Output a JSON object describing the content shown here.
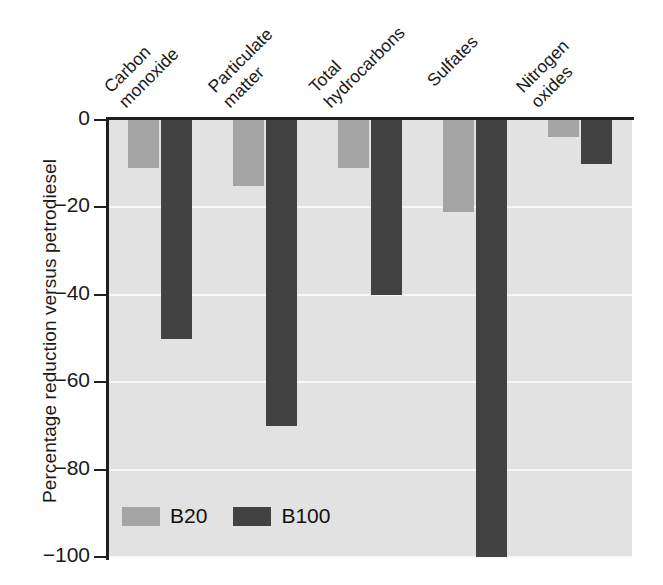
{
  "chart_data": {
    "type": "bar",
    "title": "",
    "xlabel": "",
    "ylabel": "Percentage reduction versus petrodiesel",
    "ylim": [
      -100,
      0
    ],
    "yticks": [
      0,
      -20,
      -40,
      -60,
      -80,
      -100
    ],
    "ytick_labels": [
      "0",
      "−20",
      "−40",
      "−60",
      "−80",
      "−100"
    ],
    "grid": true,
    "grid_axis": "y",
    "legend_position": "bottom-left-inside",
    "categories": [
      "Carbon monoxide",
      "Particulate matter",
      "Total hydrocarbons",
      "Sulfates",
      "Nitrogen oxides"
    ],
    "category_lines": [
      [
        "Carbon",
        "monoxide"
      ],
      [
        "Particulate",
        "matter"
      ],
      [
        "Total",
        "hydrocarbons"
      ],
      [
        "Sulfates",
        ""
      ],
      [
        "Nitrogen",
        "oxides"
      ]
    ],
    "series": [
      {
        "name": "B20",
        "color": "#a5a5a5",
        "values": [
          -11,
          -15,
          -11,
          -21,
          -4
        ]
      },
      {
        "name": "B100",
        "color": "#424242",
        "values": [
          -50,
          -70,
          -40,
          -100,
          -10
        ]
      }
    ]
  },
  "legend": {
    "entries": [
      {
        "label": "B20",
        "color": "#a5a5a5"
      },
      {
        "label": "B100",
        "color": "#424242"
      }
    ]
  },
  "colors": {
    "plot_background": "#e2e2e2",
    "gridline": "#f7f7f7",
    "axis": "#1f1f1f",
    "page_background": "#ffffff",
    "b20": "#a5a5a5",
    "b100": "#424242"
  }
}
